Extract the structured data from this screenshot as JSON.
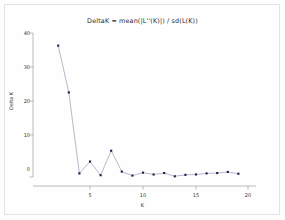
{
  "chart_data": {
    "type": "line",
    "title": "DeltaK = mean(|L''(K)|) / sd(L(K))",
    "xlabel": "K",
    "ylabel": "Delta K",
    "x": [
      2,
      3,
      4,
      5,
      6,
      7,
      8,
      9,
      10,
      11,
      12,
      13,
      14,
      15,
      16,
      17,
      18,
      19
    ],
    "values": [
      36.5,
      23.5,
      1.0,
      4.3,
      0.5,
      7.3,
      1.5,
      0.4,
      1.2,
      0.7,
      1.1,
      0.2,
      0.6,
      0.7,
      1.0,
      1.1,
      1.4,
      0.9
    ],
    "series": [
      {
        "name": "DeltaK",
        "values": [
          36.5,
          23.5,
          1.0,
          4.3,
          0.5,
          7.3,
          1.5,
          0.4,
          1.2,
          0.7,
          1.1,
          0.2,
          0.6,
          0.7,
          1.0,
          1.1,
          1.4,
          0.9
        ]
      }
    ],
    "xlim": [
      1.2,
      20.6
    ],
    "ylim": [
      -1.5,
      40.5
    ],
    "xticks": [
      5,
      10,
      15,
      20
    ],
    "xtick_labels": [
      "5",
      "10",
      "15",
      "20"
    ],
    "yticks": [
      0,
      10,
      20,
      30,
      40
    ],
    "ytick_labels": [
      "0",
      "10",
      "20",
      "30",
      "40"
    ],
    "grid": false,
    "legend": false,
    "marker": "filled-square",
    "marker_color": "#1a1a4e",
    "line_color": "#9a9ab5",
    "axis_color": "#9e9e9e"
  }
}
